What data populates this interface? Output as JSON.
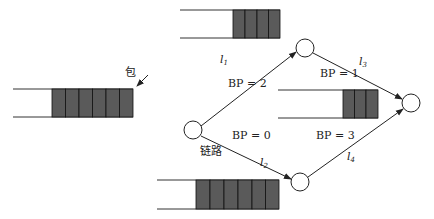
{
  "diagram": {
    "type": "network-backpressure",
    "nodes": [
      {
        "id": "src",
        "cx": 193,
        "cy": 130
      },
      {
        "id": "top",
        "cx": 305,
        "cy": 48
      },
      {
        "id": "bottom",
        "cx": 300,
        "cy": 182
      },
      {
        "id": "dst",
        "cx": 411,
        "cy": 103
      }
    ],
    "links": [
      {
        "id": "l1",
        "label": "l",
        "sub": "1",
        "bp": "BP = 2"
      },
      {
        "id": "l2",
        "label": "l",
        "sub": "2",
        "bp": "BP = 0"
      },
      {
        "id": "l3",
        "label": "l",
        "sub": "3",
        "bp": "BP = 1"
      },
      {
        "id": "l4",
        "label": "l",
        "sub": "4",
        "bp": "BP = 3"
      }
    ],
    "queues": [
      {
        "id": "source-queue",
        "packets": 5
      },
      {
        "id": "top-queue",
        "packets": 4
      },
      {
        "id": "middle-queue",
        "packets": 3
      },
      {
        "id": "bottom-queue",
        "packets": 6
      }
    ],
    "annotations": {
      "packet": "包",
      "link": "链路"
    },
    "colors": {
      "packet_fill": "#5a5a5a",
      "stroke": "#222222"
    }
  }
}
